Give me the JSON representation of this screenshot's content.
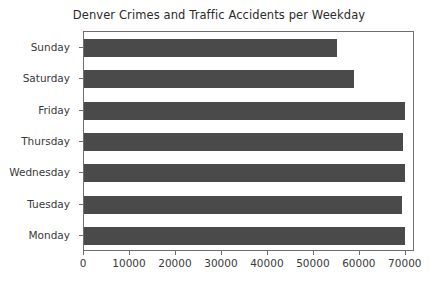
{
  "chart_data": {
    "type": "bar",
    "orientation": "horizontal",
    "title": "Denver Crimes and Traffic Accidents per Weekday",
    "xlabel": "",
    "ylabel": "",
    "categories": [
      "Sunday",
      "Saturday",
      "Friday",
      "Thursday",
      "Wednesday",
      "Tuesday",
      "Monday"
    ],
    "values": [
      55000,
      58700,
      69800,
      69400,
      69800,
      69100,
      69800
    ],
    "xlim": [
      0,
      72000
    ],
    "xticks": [
      0,
      10000,
      20000,
      30000,
      40000,
      50000,
      60000,
      70000
    ],
    "xtick_labels": [
      "0",
      "10000",
      "20000",
      "30000",
      "40000",
      "50000",
      "60000",
      "70000"
    ],
    "ytick_labels": [
      "Sunday",
      "Saturday",
      "Friday",
      "Thursday",
      "Wednesday",
      "Tuesday",
      "Monday"
    ],
    "grid": false,
    "legend": false,
    "bar_color": "#4a4a4a",
    "axis_color": "#6f6f6f",
    "text_color": "#3a3a3a",
    "background": "#ffffff"
  }
}
